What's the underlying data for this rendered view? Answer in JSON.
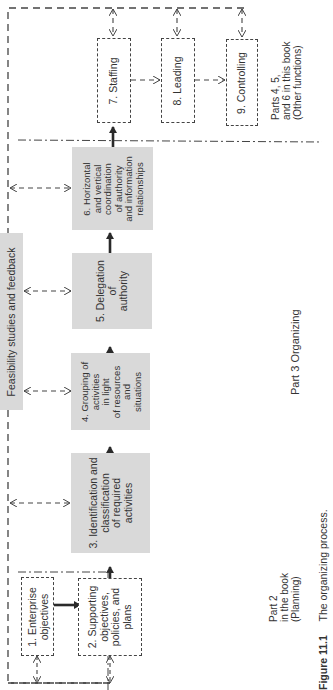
{
  "diagram": {
    "title": "The organizing process.",
    "figure_label": "Figure 11.1",
    "feedback_box": "Feasibility studies and feedback",
    "boxes": [
      {
        "id": 1,
        "lines": [
          "1.  Enterprise",
          "objectives"
        ],
        "style": "dashed"
      },
      {
        "id": 2,
        "lines": [
          "2.  Supporting",
          "objectives,",
          "policies, and",
          "plans"
        ],
        "style": "dashed"
      },
      {
        "id": 3,
        "lines": [
          "3. Identification and",
          "classification",
          "of required",
          "activities"
        ],
        "style": "gray"
      },
      {
        "id": 4,
        "lines": [
          "4. Grouping of",
          "activities",
          "in light",
          "of resources",
          "and",
          "situations"
        ],
        "style": "gray"
      },
      {
        "id": 5,
        "lines": [
          "5. Delegation",
          "of",
          "authority"
        ],
        "style": "gray"
      },
      {
        "id": 6,
        "lines": [
          "6.  Horizontal",
          "and vertical",
          "coordination",
          "of authority",
          "and information",
          "relationships"
        ],
        "style": "gray"
      },
      {
        "id": 7,
        "lines": [
          "7.  Staffing"
        ],
        "style": "dashed"
      },
      {
        "id": 8,
        "lines": [
          "8.  Leading"
        ],
        "style": "dashed"
      },
      {
        "id": 9,
        "lines": [
          "9.  Controlling"
        ],
        "style": "dashed"
      }
    ],
    "section_labels": {
      "part2": [
        "Part 2",
        "in the book",
        "(Planning)"
      ],
      "part3": "Part 3  Organizing",
      "parts456": [
        "Parts 4, 5,",
        "and 6 in this book",
        "(Other functions)"
      ]
    }
  },
  "colors": {
    "gray_box": "#d9d9d9",
    "line": "#444444",
    "arrow": "#2a2a2a"
  }
}
